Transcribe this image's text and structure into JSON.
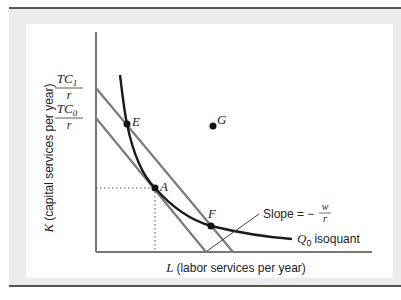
{
  "figure": {
    "axes": {
      "x_label_var": "L",
      "x_label_text": "(labor services per year)",
      "y_label_var": "K",
      "y_label_text": "(capital services per year)"
    },
    "intercepts": [
      {
        "num": "TC",
        "sub": "1",
        "den": "r"
      },
      {
        "num": "TC",
        "sub": "0",
        "den": "r"
      }
    ],
    "points": {
      "E": "E",
      "A": "A",
      "F": "F",
      "G": "G"
    },
    "annotations": {
      "slope_prefix": "Slope = −",
      "slope_num": "w",
      "slope_den": "r",
      "isoquant_var": "Q",
      "isoquant_sub": "0",
      "isoquant_text": "isoquant"
    },
    "colors": {
      "axis": "#777777",
      "isocost": "#7a7a7a",
      "isoquant": "#1a1a1a",
      "frame": "#ececec",
      "rule": "#555555"
    }
  }
}
